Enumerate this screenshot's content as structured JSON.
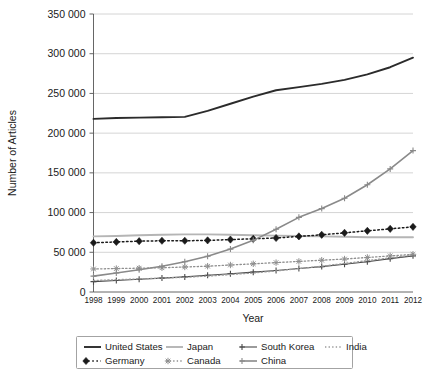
{
  "chart_data": {
    "type": "line",
    "title": "",
    "xlabel": "Year",
    "ylabel": "Number of Articles",
    "x": [
      1998,
      1999,
      2000,
      2001,
      2002,
      2003,
      2004,
      2005,
      2006,
      2007,
      2008,
      2009,
      2010,
      2011,
      2012
    ],
    "xlim": [
      1998,
      2012
    ],
    "ylim": [
      0,
      350000
    ],
    "ytick_labels": [
      "0",
      "50 000",
      "100 000",
      "150 000",
      "200 000",
      "250 000",
      "300 000",
      "350 000"
    ],
    "ytick_values": [
      0,
      50000,
      100000,
      150000,
      200000,
      250000,
      300000,
      350000
    ],
    "xtick_labels": [
      "1998",
      "1999",
      "2000",
      "2001",
      "2002",
      "2003",
      "2004",
      "2005",
      "2006",
      "2007",
      "2008",
      "2009",
      "2010",
      "2011",
      "2012"
    ],
    "grid": true,
    "legend_position": "below-plot",
    "series": [
      {
        "name": "United States",
        "color": "#2b2b2b",
        "style": "solid",
        "marker": "none",
        "width": 1.9,
        "values": [
          218000,
          219000,
          219500,
          220000,
          220500,
          228000,
          237000,
          246000,
          254000,
          258000,
          262000,
          267000,
          274000,
          283000,
          295000
        ]
      },
      {
        "name": "Japan",
        "color": "#b5b5b5",
        "style": "solid",
        "marker": "none",
        "width": 1.9,
        "values": [
          70000,
          70500,
          71500,
          72000,
          72500,
          72500,
          72000,
          71500,
          71000,
          70500,
          70000,
          69500,
          69000,
          69000,
          69000
        ]
      },
      {
        "name": "South Korea",
        "color": "#4a4a4a",
        "style": "solid",
        "marker": "plus",
        "width": 1.1,
        "values": [
          13000,
          14500,
          16000,
          17500,
          19000,
          21000,
          23000,
          25000,
          27000,
          29500,
          32000,
          35000,
          38000,
          42000,
          45500
        ]
      },
      {
        "name": "India",
        "color": "#9a9a9a",
        "style": "dotted",
        "marker": "none",
        "width": 1.3,
        "values": [
          14500,
          15500,
          16500,
          17500,
          18500,
          20000,
          22000,
          24000,
          26500,
          29500,
          32500,
          36000,
          39500,
          43000,
          46500
        ]
      },
      {
        "name": "Germany",
        "color": "#1a1a1a",
        "style": "dotted",
        "marker": "diamond",
        "width": 1.5,
        "values": [
          62000,
          63000,
          64000,
          64500,
          64500,
          65000,
          66000,
          67000,
          68000,
          70000,
          72000,
          74500,
          77000,
          79500,
          82000
        ]
      },
      {
        "name": "Canada",
        "color": "#8f8f8f",
        "style": "dotted",
        "marker": "star",
        "width": 1.3,
        "values": [
          29000,
          29500,
          30000,
          30500,
          31500,
          32500,
          34000,
          35500,
          37000,
          38500,
          40000,
          41500,
          43500,
          45500,
          47500
        ]
      },
      {
        "name": "China",
        "color": "#8a8a8a",
        "style": "solid",
        "marker": "plus",
        "width": 1.6,
        "values": [
          20000,
          24000,
          28000,
          32500,
          38000,
          45000,
          54000,
          65000,
          79000,
          94000,
          105000,
          118000,
          135000,
          155000,
          178000
        ]
      }
    ]
  },
  "legend": {
    "entries": [
      {
        "label": "United States",
        "key": "united-states"
      },
      {
        "label": "Japan",
        "key": "japan"
      },
      {
        "label": "South Korea",
        "key": "south-korea"
      },
      {
        "label": "India",
        "key": "india"
      },
      {
        "label": "Germany",
        "key": "germany"
      },
      {
        "label": "Canada",
        "key": "canada"
      },
      {
        "label": "China",
        "key": "china"
      }
    ]
  }
}
